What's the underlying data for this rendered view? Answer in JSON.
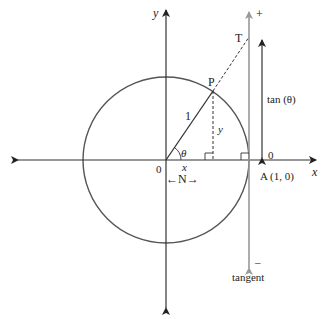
{
  "diagram": {
    "colors": {
      "axes": "#333333",
      "circle": "#555555",
      "tangent": "#999999",
      "text": "#222222"
    },
    "labels": {
      "y_axis": "y",
      "x_axis": "x",
      "origin": "0",
      "point_p": "P",
      "point_t": "T",
      "radius": "1",
      "angle": "θ",
      "y_segment": "y",
      "x_segment": "x",
      "n_label": "←N→",
      "point_a": "A (1, 0)",
      "tan_label": "tan (θ)",
      "tan_zero": "0",
      "tangent_plus": "+",
      "tangent_minus": "–",
      "tangent_name": "tangent"
    }
  }
}
